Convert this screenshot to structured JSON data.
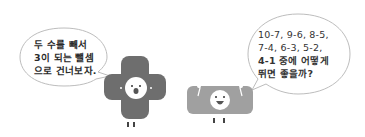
{
  "left_bubble": {
    "lines": [
      "두 수를 빼서",
      "3이 되는 뺄셈",
      "으로 건너보자."
    ]
  },
  "right_bubble": {
    "lines": [
      "10-7, 9-6, 8-5,",
      "7-4,  6-3,  5-2,",
      "4-1 중에 어떻게",
      "뛰면 좋을까?"
    ]
  },
  "characters": [
    {
      "name": "plus-shaped character",
      "color": "#6e6e6e"
    },
    {
      "name": "minus-shaped character",
      "color": "#9a9a9a"
    }
  ]
}
